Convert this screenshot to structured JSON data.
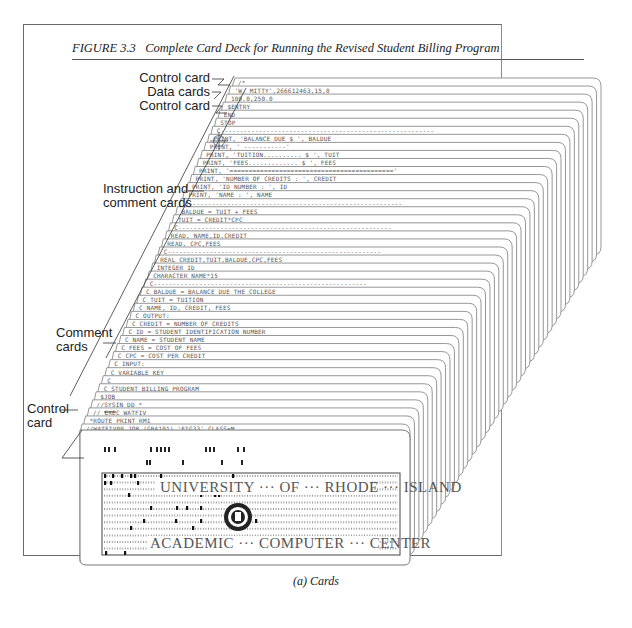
{
  "figure": {
    "number": "FIGURE 3.3",
    "title": "Complete Card Deck for Running the Revised Student Billing Program",
    "caption": "(a) Cards"
  },
  "labels": [
    {
      "id": "control-card-top",
      "text": "Control card"
    },
    {
      "id": "data-cards",
      "text": "Data cards"
    },
    {
      "id": "control-card-mid",
      "text": "Control card"
    },
    {
      "id": "instruction-comment-cards",
      "text": [
        "Instruction and",
        "comment cards"
      ]
    },
    {
      "id": "comment-cards",
      "text": [
        "Comment",
        "cards"
      ]
    },
    {
      "id": "control-card-bottom",
      "text": [
        "Control",
        "card"
      ]
    }
  ],
  "cards": [
    "/*",
    "'W. MITTY',266612463,15,0",
    "100.0,250.0",
    "$ENTRY",
    "      END",
    "      STOP",
    "C--------------------------------------------------------",
    "      PRINT, 'BALANCE DUE          $ ',      BALDUE",
    "      PRINT, '                              -----------'",
    "      PRINT, 'TUITION..........  $ ',      TUIT",
    "      PRINT, 'FEES.............  $ ',      FEES",
    "      PRINT, '==========================================='",
    "      PRINT, 'NUMBER OF CREDITS  : ',      CREDIT",
    "      PRINT, 'ID NUMBER          :         ',  ID",
    "      PRINT, 'NAME               :         ', NAME",
    "C--------------------------------------------------------",
    "      BALDUE   = TUIT + FEES",
    "      TUIT     = CREDIT*CPC",
    "C--------------------------------------------------------",
    "      READ, NAME,ID,CREDIT",
    "      READ, CPC,FEES",
    "C--------------------------------------------------------",
    "      REAL        CREDIT,TUIT,BALDUE,CPC,FEES",
    "      INTEGER     ID",
    "      CHARACTER   NAME*15",
    "C--------------------------------------------------------",
    "C            BALDUE = BALANCE DUE THE COLLEGE",
    "C            TUIT   = TUITION",
    "C            NAME, ID, CREDIT, FEES",
    "C          OUTPUT:",
    "C            CREDIT = NUMBER OF CREDITS",
    "C            ID     = STUDENT IDENTIFICATION NUMBER",
    "C            NAME   = STUDENT NAME",
    "C            FEES   = COST OF FEES",
    "C            CPC    = COST PER CREDIT",
    "C          INPUT:",
    "C          VARIABLE KEY",
    "C",
    "C          STUDENT BILLING PROGRAM",
    "$JOB",
    "//SYSIN DD *",
    "// EXEC WATFIV",
    "*ROUTE PRINT RM1",
    "//WATFIV00 JOB (GBA101),'FIG33',CLASS=M"
  ],
  "front_card": {
    "line1": "UNIVERSITY ··· OF ··· RHODE ··· ISLAND",
    "line2": "ACADEMIC ··· COMPUTER ··· CENTER",
    "words_top": [
      "UNIVERSITY",
      "OF",
      "RHODE",
      "ISLAND"
    ],
    "words_bottom": [
      "ACADEMIC",
      "COMPUTER",
      "CENTER"
    ]
  }
}
